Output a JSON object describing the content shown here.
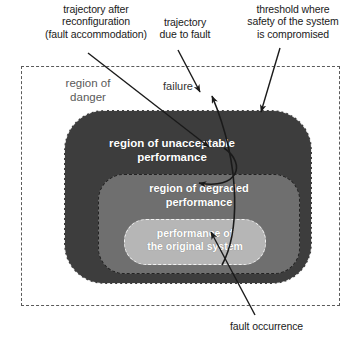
{
  "figure": {
    "kind": "nested-region-trajectory-diagram"
  },
  "annotations": {
    "trajectory_after_reconfiguration": "trajectory after\nreconfiguration\n(fault accommodation)",
    "trajectory_due_to_fault": "trajectory\ndue to fault",
    "threshold": "threshold where\nsafety of the system\nis compromised",
    "fault_occurrence": "fault occurrence",
    "failure": "failure"
  },
  "regions": {
    "danger": {
      "label": "region of\ndanger",
      "fill": "#ffffff",
      "border": "#5a5a5a",
      "border_style": "dashed",
      "text_color": "#5a5a5a"
    },
    "unacceptable": {
      "label": "region of unacceptable\nperformance",
      "fill": "#3d3d3d",
      "border": "#e8e8e8",
      "border_style": "dashed",
      "text_color": "#ffffff"
    },
    "degraded": {
      "label": "region of degraded\nperformance",
      "fill": "#6f6f6f",
      "border": "#232323",
      "border_style": "dashed",
      "text_color": "#ffffff"
    },
    "original": {
      "label": "performance of\nthe original system",
      "fill": "#b6b6b6",
      "border": "#f2f2f2",
      "border_style": "dashed",
      "text_color": "#ffffff"
    }
  },
  "colors": {
    "stroke": "#1a1a1a",
    "background": "#ffffff"
  }
}
